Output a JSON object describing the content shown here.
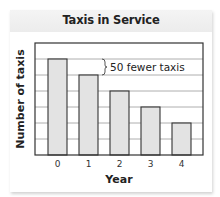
{
  "chart_data": {
    "type": "bar",
    "title": "Taxis in Service",
    "xlabel": "Year",
    "ylabel": "Number of taxis",
    "categories": [
      "0",
      "1",
      "2",
      "3",
      "4"
    ],
    "values": [
      300,
      250,
      200,
      150,
      100
    ],
    "grid_units_per_line": 50,
    "bar_heights_in_gridlines": [
      6,
      5,
      4,
      3,
      2
    ],
    "ylim": [
      0,
      350
    ],
    "y_tick_labels_shown": false,
    "grid": true,
    "legend": null,
    "annotations": [
      {
        "text": "50 fewer taxis",
        "type": "brace",
        "between_categories": [
          "0",
          "1"
        ]
      }
    ],
    "colors": {
      "bar_fill": "#e3e3e3",
      "bar_stroke": "#333333",
      "grid": "#9a9a9a",
      "frame": "#333333"
    }
  },
  "labels": {
    "title": "Taxis in Service",
    "xlabel": "Year",
    "ylabel": "Number of taxis",
    "annotation": "50 fewer taxis",
    "ticks": [
      "0",
      "1",
      "2",
      "3",
      "4"
    ]
  }
}
